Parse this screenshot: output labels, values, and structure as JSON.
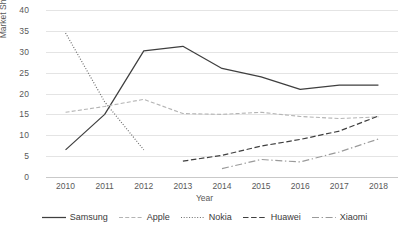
{
  "chart_data": {
    "type": "line",
    "title": "",
    "xlabel": "Year",
    "ylabel": "Market Share (%)",
    "categories": [
      "2010",
      "2011",
      "2012",
      "2013",
      "2014",
      "2015",
      "2016",
      "2017",
      "2018"
    ],
    "x": [
      2010,
      2011,
      2012,
      2013,
      2014,
      2015,
      2016,
      2017,
      2018
    ],
    "ylim": [
      0,
      40
    ],
    "yticks": [
      0,
      5,
      10,
      15,
      20,
      25,
      30,
      35,
      40
    ],
    "grid": true,
    "legend_position": "bottom",
    "series": [
      {
        "name": "Samsung",
        "style": "solid",
        "color": "#3f3f3f",
        "values": [
          6.5,
          15.0,
          30.2,
          31.3,
          26.0,
          24.0,
          21.0,
          22.0,
          22.0
        ]
      },
      {
        "name": "Apple",
        "style": "dashed-fine",
        "color": "#b4b4b4",
        "values": [
          15.5,
          16.9,
          18.6,
          15.2,
          15.0,
          15.5,
          14.5,
          14.0,
          14.4
        ]
      },
      {
        "name": "Nokia",
        "style": "dotted",
        "color": "#6e6e6e",
        "values": [
          34.5,
          18.0,
          6.5,
          null,
          null,
          null,
          null,
          null,
          null
        ]
      },
      {
        "name": "Huawei",
        "style": "dashed",
        "color": "#3f3f3f",
        "values": [
          null,
          null,
          null,
          3.8,
          5.2,
          7.4,
          9.0,
          11.0,
          14.6
        ]
      },
      {
        "name": "Xiaomi",
        "style": "dash-dot",
        "color": "#9a9a9a",
        "values": [
          null,
          null,
          null,
          null,
          2.0,
          4.2,
          3.6,
          6.0,
          9.1
        ]
      }
    ],
    "legend": [
      "Samsung",
      "Apple",
      "Nokia",
      "Huawei",
      "Xiaomi"
    ]
  }
}
